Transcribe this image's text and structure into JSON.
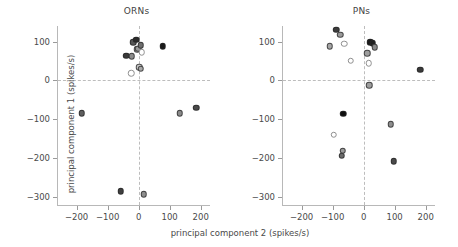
{
  "figure": {
    "xlabel": "principal component 2 (spikes/s)",
    "ylabel": "principal component 1 (spikes/s)"
  },
  "chart_data": {
    "type": "scatter",
    "title": "",
    "xlabel": "principal component 2 (spikes/s)",
    "ylabel": "principal component 1 (spikes/s)",
    "xlim": [
      -260,
      230
    ],
    "ylim": [
      -320,
      140
    ],
    "xticks": [
      -200,
      -100,
      0,
      100,
      200
    ],
    "xticklabels": [
      "−200",
      "−100",
      "0",
      "100",
      "200"
    ],
    "yticks": [
      100,
      0,
      -100,
      -200,
      -300
    ],
    "yticklabels": [
      "100",
      "0",
      "−100",
      "−200",
      "−300"
    ],
    "grid": false,
    "legend": null,
    "reference_lines": {
      "vertical_at_x": 0,
      "horizontal_at_y": 0,
      "style": "dashed"
    },
    "marker": "circle",
    "panels": [
      {
        "name": "ORNs",
        "title": "ORNs",
        "points": [
          {
            "x": -40,
            "y": 64,
            "fill": "#3a3a3a"
          },
          {
            "x": -22,
            "y": 62,
            "fill": "#8c8c8c"
          },
          {
            "x": -18,
            "y": 98,
            "fill": "#555555"
          },
          {
            "x": -8,
            "y": 105,
            "fill": "#2b2b2b"
          },
          {
            "x": -5,
            "y": 80,
            "fill": "#b0b0b0"
          },
          {
            "x": -2,
            "y": 82,
            "fill": "#9a9a9a"
          },
          {
            "x": 6,
            "y": 90,
            "fill": "#6e6e6e"
          },
          {
            "x": 10,
            "y": 72,
            "fill": "#ffffff"
          },
          {
            "x": -24,
            "y": 18,
            "fill": "#ffffff"
          },
          {
            "x": 2,
            "y": 34,
            "fill": "#c8c8c8"
          },
          {
            "x": 6,
            "y": 30,
            "fill": "#a8a8a8"
          },
          {
            "x": 78,
            "y": 88,
            "fill": "#1a1a1a"
          },
          {
            "x": -183,
            "y": -84,
            "fill": "#5e5e5e"
          },
          {
            "x": 132,
            "y": -84,
            "fill": "#8a8a8a"
          },
          {
            "x": 186,
            "y": -70,
            "fill": "#4a4a4a"
          },
          {
            "x": -57,
            "y": -285,
            "fill": "#3f3f3f"
          },
          {
            "x": 16,
            "y": -293,
            "fill": "#8e8e8e"
          }
        ]
      },
      {
        "name": "PNs",
        "title": "PNs",
        "points": [
          {
            "x": -88,
            "y": 130,
            "fill": "#3c3c3c"
          },
          {
            "x": -76,
            "y": 118,
            "fill": "#9a9a9a"
          },
          {
            "x": -110,
            "y": 88,
            "fill": "#a6a6a6"
          },
          {
            "x": -62,
            "y": 95,
            "fill": "#ffffff"
          },
          {
            "x": -42,
            "y": 51,
            "fill": "#ffffff"
          },
          {
            "x": 22,
            "y": 98,
            "fill": "#1a1a1a"
          },
          {
            "x": 29,
            "y": 96,
            "fill": "#202020"
          },
          {
            "x": 36,
            "y": 86,
            "fill": "#8a8a8a"
          },
          {
            "x": 12,
            "y": 70,
            "fill": "#9e9e9e"
          },
          {
            "x": 16,
            "y": 44,
            "fill": "#ffffff"
          },
          {
            "x": 182,
            "y": 28,
            "fill": "#3a3a3a"
          },
          {
            "x": 18,
            "y": -12,
            "fill": "#9e9e9e"
          },
          {
            "x": -66,
            "y": -86,
            "fill": "#0f0f0f"
          },
          {
            "x": -96,
            "y": -139,
            "fill": "#ffffff"
          },
          {
            "x": -68,
            "y": -180,
            "fill": "#9a9a9a"
          },
          {
            "x": -70,
            "y": -194,
            "fill": "#6a6a6a"
          },
          {
            "x": 88,
            "y": -112,
            "fill": "#8e8e8e"
          },
          {
            "x": 97,
            "y": -208,
            "fill": "#4a4a4a"
          }
        ]
      }
    ]
  }
}
